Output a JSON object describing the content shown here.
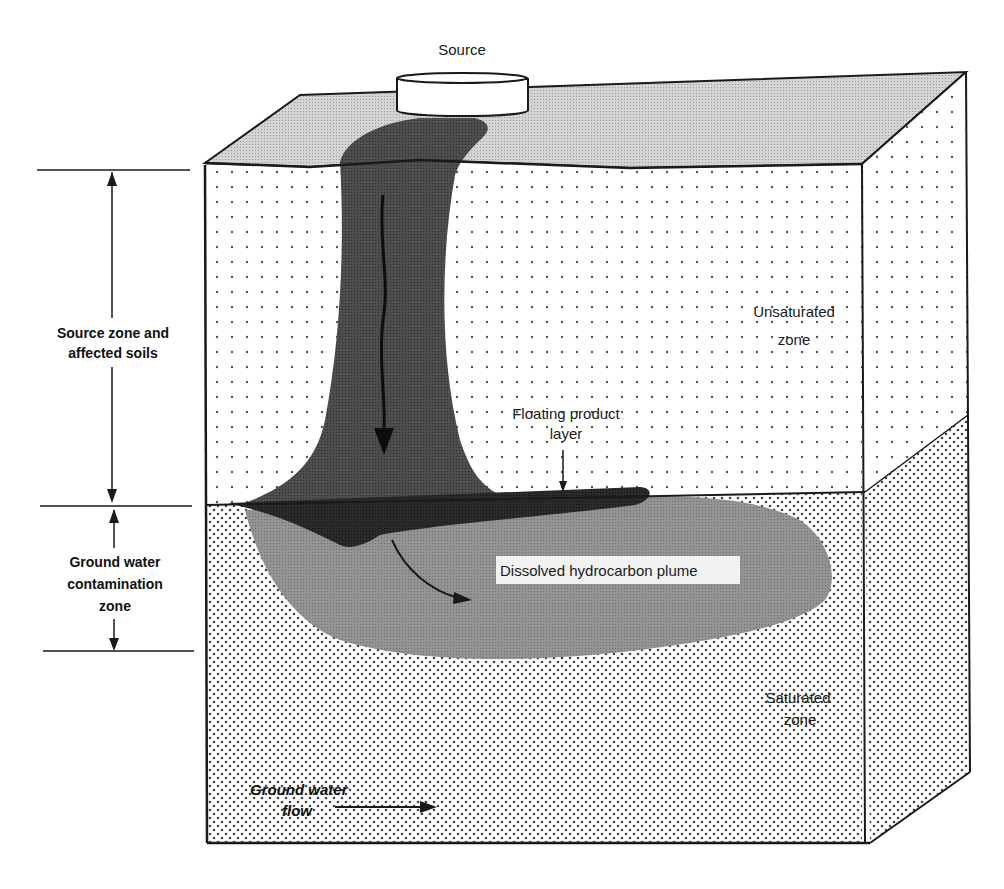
{
  "diagram": {
    "type": "cross-section block diagram",
    "colors": {
      "background": "#ffffff",
      "outline": "#1a1a1a",
      "ground_surface": "#c8c8c8",
      "source_plume": "#4a4a4a",
      "floating_product": "#262626",
      "dissolved_plume": "#8c8c8c",
      "unsaturated_dots": "#555555",
      "saturated_dots": "#444444",
      "label_highlight": "#f2f2f2"
    },
    "labels": {
      "source": "Source",
      "unsaturated_zone_line1": "Unsaturated",
      "unsaturated_zone_line2": "zone",
      "floating_product_line1": "Floating product",
      "floating_product_line2": "layer",
      "dissolved_plume": "Dissolved hydrocarbon plume",
      "saturated_zone_line1": "Saturated",
      "saturated_zone_line2": "zone",
      "ground_water_flow_line1": "Ground water",
      "ground_water_flow_line2": "flow"
    },
    "dimension_annotations": [
      {
        "id": "source-zone",
        "line1": "Source zone and",
        "line2": "affected soils"
      },
      {
        "id": "groundwater-zone",
        "line1": "Ground water",
        "line2": "contamination",
        "line3": "zone"
      }
    ],
    "zones": [
      {
        "name": "Unsaturated zone",
        "pattern": "sparse dots"
      },
      {
        "name": "Saturated zone",
        "pattern": "dense dots"
      }
    ]
  }
}
